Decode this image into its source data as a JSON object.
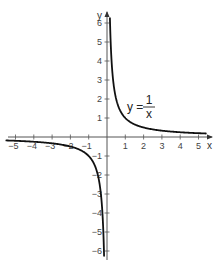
{
  "chart_data": {
    "type": "line",
    "title": "",
    "function": "y = 1/x",
    "xlabel": "x",
    "ylabel": "y",
    "xlim": [
      -5.5,
      5.5
    ],
    "ylim": [
      -6.3,
      6.3
    ],
    "grid": false,
    "x_ticks": [
      -5,
      -4,
      -3,
      -2,
      -1,
      1,
      2,
      3,
      4,
      5
    ],
    "x_tick_labels": [
      "−5",
      "−4",
      "−3",
      "−2",
      "−1",
      "1",
      "2",
      "3",
      "4",
      "5"
    ],
    "y_ticks": [
      6,
      5,
      4,
      3,
      2,
      1,
      -1,
      -2,
      -3,
      -4,
      -5,
      -6
    ],
    "y_tick_labels": [
      "6",
      "5",
      "4",
      "3",
      "2",
      "1",
      "−1",
      "−2",
      "−3",
      "−4",
      "−5",
      "−6"
    ],
    "annotation": {
      "lhs": "y =",
      "numerator": "1",
      "denominator": "x"
    },
    "series": [
      {
        "name": "y = 1/x (x > 0)",
        "x": [
          0.16,
          0.2,
          0.25,
          0.333,
          0.5,
          1,
          2,
          3,
          4,
          5,
          5.4
        ],
        "y": [
          6.25,
          5,
          4,
          3,
          2,
          1,
          0.5,
          0.333,
          0.25,
          0.2,
          0.185
        ]
      },
      {
        "name": "y = 1/x (x < 0)",
        "x": [
          -5.5,
          -5,
          -4,
          -3,
          -2,
          -1,
          -0.5,
          -0.333,
          -0.25,
          -0.2,
          -0.16
        ],
        "y": [
          -0.182,
          -0.2,
          -0.25,
          -0.333,
          -0.5,
          -1,
          -2,
          -3,
          -4,
          -5,
          -6.25
        ]
      }
    ],
    "colors": {
      "curve": "#111111",
      "axis": "#555555",
      "text": "#444444"
    }
  }
}
